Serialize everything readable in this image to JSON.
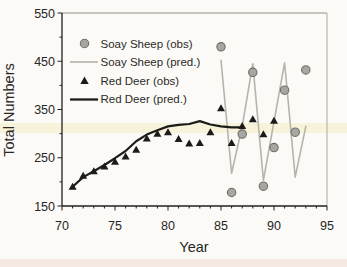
{
  "chart_data": {
    "type": "line",
    "title": "",
    "xlabel": "Year",
    "ylabel": "Total Numbers",
    "xlim": [
      70,
      95
    ],
    "ylim": [
      150,
      550
    ],
    "x_ticks": [
      70,
      75,
      80,
      85,
      90,
      95
    ],
    "y_ticks": [
      150,
      250,
      350,
      450,
      550
    ],
    "x_minor_step": 1,
    "y_minor_step": 50,
    "grid": false,
    "legend_position": "top-left",
    "series": [
      {
        "name": "Soay Sheep (obs)",
        "kind": "scatter",
        "marker": "circle",
        "color": "#a7a6a1",
        "stroke": "#6f6f6a",
        "x": [
          85,
          86,
          87,
          88,
          89,
          90,
          91,
          92,
          93
        ],
        "y": [
          480,
          178,
          299,
          427,
          191,
          271,
          390,
          303,
          432
        ]
      },
      {
        "name": "Soay Sheep (pred.)",
        "kind": "line",
        "color": "#b5b4ae",
        "width": 1.6,
        "x": [
          85,
          86,
          87,
          88,
          89,
          90,
          91,
          92,
          93
        ],
        "y": [
          452,
          218,
          315,
          445,
          203,
          325,
          447,
          210,
          315
        ]
      },
      {
        "name": "Red Deer (obs)",
        "kind": "scatter",
        "marker": "triangle",
        "color": "#1b1b19",
        "stroke": "#1b1b19",
        "x": [
          71,
          72,
          73,
          74,
          75,
          76,
          77,
          78,
          79,
          80,
          81,
          82,
          83,
          84,
          85,
          86,
          87,
          88,
          89,
          90
        ],
        "y": [
          190,
          213,
          222,
          232,
          242,
          253,
          267,
          290,
          300,
          303,
          289,
          280,
          281,
          303,
          353,
          281,
          316,
          330,
          299,
          327
        ]
      },
      {
        "name": "Red Deer (pred.)",
        "kind": "line",
        "color": "#1c1c1a",
        "width": 2.2,
        "x": [
          71,
          72,
          73,
          74,
          75,
          76,
          77,
          78,
          79,
          80,
          81,
          82,
          83,
          84,
          85,
          86,
          87
        ],
        "y": [
          190,
          210,
          222,
          235,
          249,
          264,
          284,
          298,
          307,
          315,
          318,
          320,
          326,
          319,
          315,
          313,
          313
        ]
      }
    ]
  }
}
